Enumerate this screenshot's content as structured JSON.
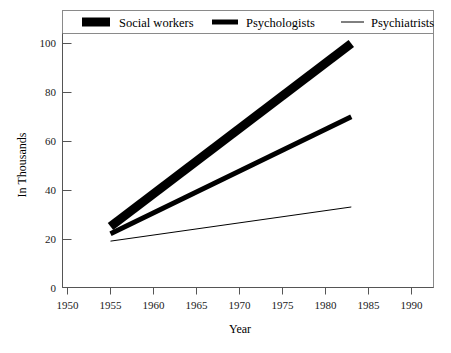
{
  "chart_data": {
    "type": "line",
    "title": "",
    "xlabel": "Year",
    "ylabel": "In Thousands",
    "xlim": [
      1950,
      1990
    ],
    "ylim": [
      0,
      100
    ],
    "grid": false,
    "legend_position": "top",
    "xticks": [
      "1950",
      "1955",
      "1960",
      "1965",
      "1970",
      "1975",
      "1980",
      "1985",
      "1990"
    ],
    "yticks": [
      "0",
      "20",
      "40",
      "60",
      "80",
      "100"
    ],
    "x": [
      1955,
      1983
    ],
    "series": [
      {
        "name": "Social workers",
        "values": [
          25,
          100
        ],
        "style": "thick",
        "color": "#000000"
      },
      {
        "name": "Psychologists",
        "values": [
          22,
          70
        ],
        "style": "medium",
        "color": "#000000"
      },
      {
        "name": "Psychiatrists",
        "values": [
          19,
          33
        ],
        "style": "thin",
        "color": "#000000"
      }
    ]
  },
  "legend": {
    "items": [
      {
        "label": "Social workers"
      },
      {
        "label": "Psychologists"
      },
      {
        "label": "Psychiatrists"
      }
    ]
  },
  "axes": {
    "y_title": "In Thousands",
    "x_title": "Year",
    "y_ticks": [
      {
        "label": "100"
      },
      {
        "label": "80"
      },
      {
        "label": "60"
      },
      {
        "label": "40"
      },
      {
        "label": "20"
      },
      {
        "label": "0"
      }
    ],
    "x_ticks": [
      {
        "label": "1950"
      },
      {
        "label": "1955"
      },
      {
        "label": "1960"
      },
      {
        "label": "1965"
      },
      {
        "label": "1970"
      },
      {
        "label": "1975"
      },
      {
        "label": "1980"
      },
      {
        "label": "1985"
      },
      {
        "label": "1990"
      }
    ]
  }
}
